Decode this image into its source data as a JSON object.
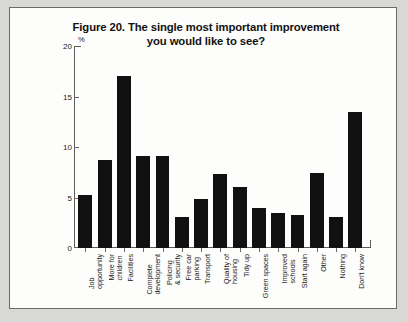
{
  "figure": {
    "title_line_1": "Figure 20. The single most important improvement",
    "title_line_2": "you would like to see?",
    "unit_label": "%"
  },
  "chart_data": {
    "type": "bar",
    "title": "Figure 20. The single most important improvement you would like to see?",
    "xlabel": "",
    "ylabel": "%",
    "ylim": [
      0,
      20
    ],
    "yticks": [
      0,
      5,
      10,
      15,
      20
    ],
    "grid": false,
    "legend": "none",
    "bar_color": "#111111",
    "categories": [
      "Job opportunity",
      "More for children",
      "Facilities",
      "Complete development",
      "Policing & security",
      "Free car parking",
      "Transport",
      "Quality of housing",
      "Tidy up",
      "Green spaces",
      "Improved schools",
      "Start again",
      "Other",
      "Nothing",
      "Don't know"
    ],
    "category_lines": [
      [
        "Job",
        "opportunity"
      ],
      [
        "More for",
        "children"
      ],
      [
        "Facilities"
      ],
      [
        "Complete",
        "development"
      ],
      [
        "Policing",
        "& security"
      ],
      [
        "Free car",
        "parking"
      ],
      [
        "Transport"
      ],
      [
        "Quality of",
        "housing"
      ],
      [
        "Tidy up"
      ],
      [
        "Green spaces"
      ],
      [
        "Improved",
        "schools"
      ],
      [
        "Start again"
      ],
      [
        "Other"
      ],
      [
        "Nothing"
      ],
      [
        "Don't know"
      ]
    ],
    "values": [
      5.2,
      8.7,
      17.0,
      9.1,
      9.1,
      3.1,
      4.9,
      7.3,
      6.0,
      4.0,
      3.5,
      3.3,
      7.4,
      3.1,
      13.5
    ]
  }
}
